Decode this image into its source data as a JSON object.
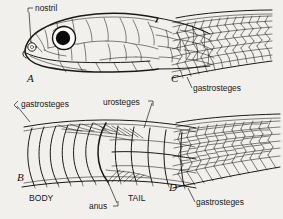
{
  "figure": {
    "background_color": "#f2f0ec",
    "ink_color": "#1a1a1a",
    "panels": [
      {
        "letter": "A",
        "name": "head-lateral",
        "description": "Lateral view of snake head showing head shields, eye and nostril",
        "labels": [
          {
            "text": "nostril",
            "name": "nostril-label"
          }
        ]
      },
      {
        "letter": "B",
        "name": "ventral-body-tail",
        "description": "Ventral view of body and tail showing gastrosteges, anus and urosteges",
        "labels": [
          {
            "text": "gastrosteges",
            "name": "gastrosteges-label"
          },
          {
            "text": "urosteges",
            "name": "urosteges-label"
          },
          {
            "text": "BODY",
            "name": "body-label"
          },
          {
            "text": "anus",
            "name": "anus-label"
          },
          {
            "text": "TAIL",
            "name": "tail-label"
          }
        ]
      },
      {
        "letter": "C",
        "name": "smooth-scales",
        "description": "Smooth dorsal scales in oblique rows with ventral gastrosteges",
        "labels": [
          {
            "text": "gastrosteges",
            "name": "gastrosteges-label"
          }
        ]
      },
      {
        "letter": "D",
        "name": "keeled-scales",
        "description": "Keeled dorsal scales in oblique rows with ventral gastrosteges",
        "labels": [
          {
            "text": "gastrosteges",
            "name": "gastrosteges-label"
          }
        ]
      }
    ]
  },
  "labels": {
    "nostril": "nostril",
    "gastrosteges_b": "gastrosteges",
    "urosteges": "urosteges",
    "body": "BODY",
    "anus": "anus",
    "tail": "TAIL",
    "gastrosteges_c": "gastrosteges",
    "gastrosteges_d": "gastrosteges",
    "letter_a": "A",
    "letter_b": "B",
    "letter_c": "C",
    "letter_d": "D"
  }
}
